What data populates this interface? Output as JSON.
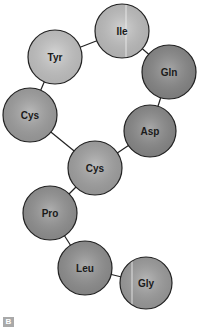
{
  "diagram": {
    "type": "peptide-chain",
    "panel_label": "B",
    "residues": [
      {
        "name": "Ile",
        "cx": 122,
        "cy": 31,
        "r": 27,
        "fill": "#c4c4c4",
        "stripe_x": 126
      },
      {
        "name": "Tyr",
        "cx": 55,
        "cy": 57,
        "r": 27,
        "fill": "#c9c9c9"
      },
      {
        "name": "Gln",
        "cx": 169,
        "cy": 72,
        "r": 27,
        "fill": "#8a8a8a"
      },
      {
        "name": "Cys",
        "cx": 30,
        "cy": 115,
        "r": 27,
        "fill": "#a3a3a3"
      },
      {
        "name": "Asp",
        "cx": 150,
        "cy": 131,
        "r": 26,
        "fill": "#8c8c8c"
      },
      {
        "name": "Cys",
        "cx": 95,
        "cy": 168,
        "r": 27,
        "fill": "#a6a6a6"
      },
      {
        "name": "Pro",
        "cx": 50,
        "cy": 213,
        "r": 27,
        "fill": "#959595"
      },
      {
        "name": "Leu",
        "cx": 85,
        "cy": 268,
        "r": 27,
        "fill": "#939393"
      },
      {
        "name": "Gly",
        "cx": 146,
        "cy": 283,
        "r": 26,
        "fill": "#a0a0a0",
        "stripe_x": 132
      }
    ],
    "bonds": [
      [
        0,
        1
      ],
      [
        0,
        2
      ],
      [
        1,
        3
      ],
      [
        2,
        4
      ],
      [
        3,
        5
      ],
      [
        4,
        5
      ],
      [
        5,
        6
      ],
      [
        6,
        7
      ],
      [
        7,
        8
      ]
    ],
    "colors": {
      "outline": "#222222",
      "bond": "#222222",
      "stripe": "#f2f2f2"
    }
  }
}
